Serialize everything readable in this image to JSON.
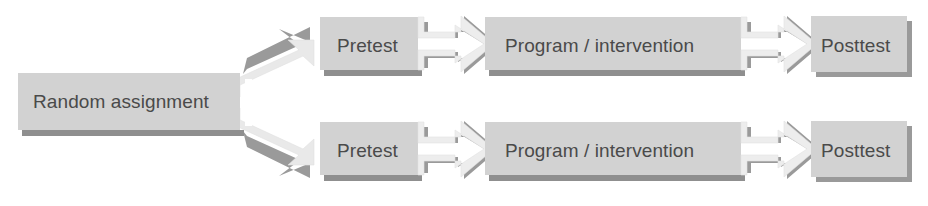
{
  "diagram": {
    "type": "flowchart",
    "background_color": "#ffffff",
    "palette": {
      "box_fill": "#d2d2d2",
      "box_fill_light": "#d8d8d8",
      "arrow_fill": "#efefef",
      "arrow_shadow": "#9a9a9a",
      "box_shadow": "#8f8f8f",
      "text_color": "#4a4a4a"
    },
    "source_node": {
      "id": "random-assignment",
      "label": "Random assignment"
    },
    "groups": [
      {
        "id": "group-1",
        "steps": [
          {
            "id": "pretest-1",
            "label": "Pretest"
          },
          {
            "id": "program-1",
            "label": "Program / intervention"
          },
          {
            "id": "posttest-1",
            "label": "Posttest"
          }
        ]
      },
      {
        "id": "group-2",
        "steps": [
          {
            "id": "pretest-2",
            "label": "Pretest"
          },
          {
            "id": "program-2",
            "label": "Program / intervention"
          },
          {
            "id": "posttest-2",
            "label": "Posttest"
          }
        ]
      }
    ],
    "connectors": [
      {
        "id": "fork-arrow-top",
        "from": "random-assignment",
        "to": "pretest-1",
        "shape": "arrow-right"
      },
      {
        "id": "fork-arrow-bottom",
        "from": "random-assignment",
        "to": "pretest-2",
        "shape": "arrow-right"
      },
      {
        "id": "arrow-pre-prog-1",
        "from": "pretest-1",
        "to": "program-1",
        "shape": "arrow-right"
      },
      {
        "id": "arrow-prog-post-1",
        "from": "program-1",
        "to": "posttest-1",
        "shape": "arrow-right"
      },
      {
        "id": "arrow-pre-prog-2",
        "from": "pretest-2",
        "to": "program-2",
        "shape": "arrow-right"
      },
      {
        "id": "arrow-prog-post-2",
        "from": "program-2",
        "to": "posttest-2",
        "shape": "arrow-right"
      }
    ]
  }
}
